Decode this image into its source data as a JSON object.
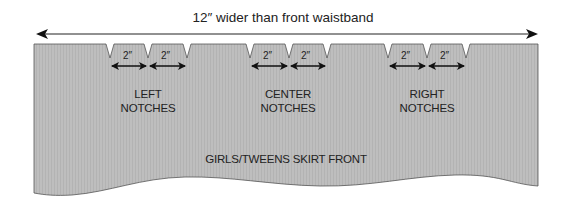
{
  "diagram": {
    "title": "12″ wider than front waistband",
    "piece_label": "GIRLS/TWEENS SKIRT FRONT",
    "notch_spacing_label": "2″",
    "notch_groups": [
      {
        "line1": "LEFT",
        "line2": "NOTCHES"
      },
      {
        "line1": "CENTER",
        "line2": "NOTCHES"
      },
      {
        "line1": "RIGHT",
        "line2": "NOTCHES"
      }
    ],
    "colors": {
      "fabric_fill": "#bdbdbd",
      "outline": "#333333",
      "arrow": "#111111",
      "background": "#ffffff"
    }
  }
}
